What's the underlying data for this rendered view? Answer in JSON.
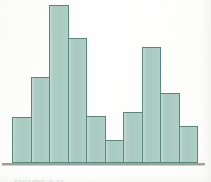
{
  "figure": {
    "caption": "FIGURE 2.11",
    "background_color": "#fdfdfc",
    "baseline_color": "#8e8e8e"
  },
  "chart_data": {
    "type": "bar",
    "title": "",
    "subtitle": "",
    "xlabel": "",
    "ylabel": "",
    "grid": false,
    "legend": false,
    "legend_position": "none",
    "bar_fill_color": "#a8cac0",
    "bar_border_color": "#54897c",
    "categories": [
      "1",
      "2",
      "3",
      "4",
      "5",
      "6",
      "7",
      "8",
      "9",
      "10"
    ],
    "values": [
      46,
      86,
      158,
      125,
      47,
      23,
      51,
      116,
      70,
      37
    ],
    "ylim": [
      0,
      160
    ],
    "xlim": [
      0,
      10
    ],
    "tick_labels_x": [],
    "tick_labels_y": [],
    "annotations": []
  },
  "bars": [
    {
      "index": 1,
      "label": "1",
      "value": 46
    },
    {
      "index": 2,
      "label": "2",
      "value": 86
    },
    {
      "index": 3,
      "label": "3",
      "value": 158
    },
    {
      "index": 4,
      "label": "4",
      "value": 125
    },
    {
      "index": 5,
      "label": "5",
      "value": 47
    },
    {
      "index": 6,
      "label": "6",
      "value": 23
    },
    {
      "index": 7,
      "label": "7",
      "value": 51
    },
    {
      "index": 8,
      "label": "8",
      "value": 116
    },
    {
      "index": 9,
      "label": "9",
      "value": 70
    },
    {
      "index": 10,
      "label": "10",
      "value": 37
    }
  ]
}
